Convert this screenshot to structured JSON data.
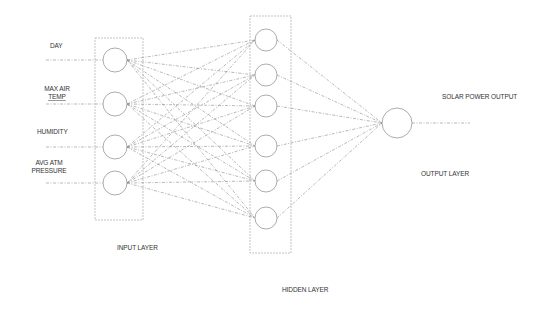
{
  "diagram": {
    "type": "neural-network",
    "input_labels": [
      {
        "lines": [
          "DAY"
        ],
        "x": 48,
        "y": 42
      },
      {
        "lines": [
          "MAX AIR",
          "TEMP"
        ],
        "x": 42,
        "y": 86
      },
      {
        "lines": [
          "HUMIDITY"
        ],
        "x": 37,
        "y": 128
      },
      {
        "lines": [
          "AVG ATM",
          "PRESSURE"
        ],
        "x": 30,
        "y": 160
      }
    ],
    "layers": {
      "input": {
        "label": "INPUT LAYER",
        "box": [
          95,
          38,
          143,
          220
        ],
        "nodes": [
          [
            115,
            60
          ],
          [
            115,
            104
          ],
          [
            115,
            147
          ],
          [
            115,
            183
          ]
        ],
        "r": 12
      },
      "hidden": {
        "label": "HIDDEN LAYER",
        "box": [
          250,
          16,
          291,
          253
        ],
        "nodes": [
          [
            266,
            40
          ],
          [
            266,
            75
          ],
          [
            266,
            106
          ],
          [
            266,
            146
          ],
          [
            266,
            181
          ],
          [
            266,
            218
          ]
        ],
        "r": 11
      },
      "output": {
        "label": "OUTPUT LAYER",
        "nodes": [
          [
            397,
            123
          ]
        ],
        "r": 15
      }
    },
    "output_label": "SOLAR POWER OUTPUT",
    "colors": {
      "line": "#8a8a8a",
      "node": "#888888",
      "box": "#9a9a9a",
      "text": "#333333"
    }
  },
  "labels": {
    "day": "DAY",
    "max_air_1": "MAX AIR",
    "max_air_2": "TEMP",
    "humidity": "HUMIDITY",
    "avg_atm_1": "AVG ATM",
    "avg_atm_2": "PRESSURE",
    "input_layer": "INPUT LAYER",
    "hidden_layer": "HIDDEN LAYER",
    "output_layer": "OUTPUT LAYER",
    "solar_power_output": "SOLAR POWER OUTPUT"
  }
}
